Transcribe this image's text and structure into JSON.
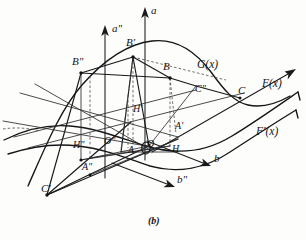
{
  "figure": {
    "caption": "(b)",
    "background_color": "#fdfdfb",
    "ink_color": "#17181a",
    "width": 306,
    "height": 240,
    "axes": [
      {
        "id": "axis-a",
        "label": "a",
        "x": 151,
        "y": 11
      },
      {
        "id": "axis-a2",
        "label": "a\"",
        "x": 112,
        "y": 29
      },
      {
        "id": "axis-b",
        "label": "b",
        "x": 214,
        "y": 159
      },
      {
        "id": "axis-b2",
        "label": "b\"",
        "x": 177,
        "y": 180
      }
    ],
    "points": [
      {
        "id": "point-B2",
        "label": "B\"",
        "x": 72,
        "y": 62
      },
      {
        "id": "point-B1",
        "label": "B'",
        "x": 126,
        "y": 43
      },
      {
        "id": "point-B",
        "label": "B",
        "x": 163,
        "y": 67
      },
      {
        "id": "point-H1",
        "label": "H'",
        "x": 133,
        "y": 110
      },
      {
        "id": "point-A1",
        "label": "A'",
        "x": 175,
        "y": 127
      },
      {
        "id": "point-H2",
        "label": "H\"",
        "x": 73,
        "y": 146
      },
      {
        "id": "point-O2",
        "label": "O\"",
        "x": 104,
        "y": 142
      },
      {
        "id": "point-A",
        "label": "A",
        "x": 128,
        "y": 151
      },
      {
        "id": "point-O",
        "label": "O",
        "x": 147,
        "y": 145
      },
      {
        "id": "point-H",
        "label": "H",
        "x": 172,
        "y": 150
      },
      {
        "id": "point-A2",
        "label": "A\"",
        "x": 82,
        "y": 168
      },
      {
        "id": "point-C1",
        "label": "C'",
        "x": 41,
        "y": 189
      },
      {
        "id": "point-C2",
        "label": "C\"",
        "x": 195,
        "y": 90
      },
      {
        "id": "point-C",
        "label": "C",
        "x": 238,
        "y": 91
      }
    ],
    "curves": [
      {
        "id": "curve-Gx",
        "label": "G(x)",
        "x": 197,
        "y": 65
      },
      {
        "id": "curve-Fx",
        "label": "F(x)",
        "x": 262,
        "y": 84
      },
      {
        "id": "curve-Fpx",
        "label": "F'(x)",
        "x": 256,
        "y": 132
      }
    ]
  }
}
